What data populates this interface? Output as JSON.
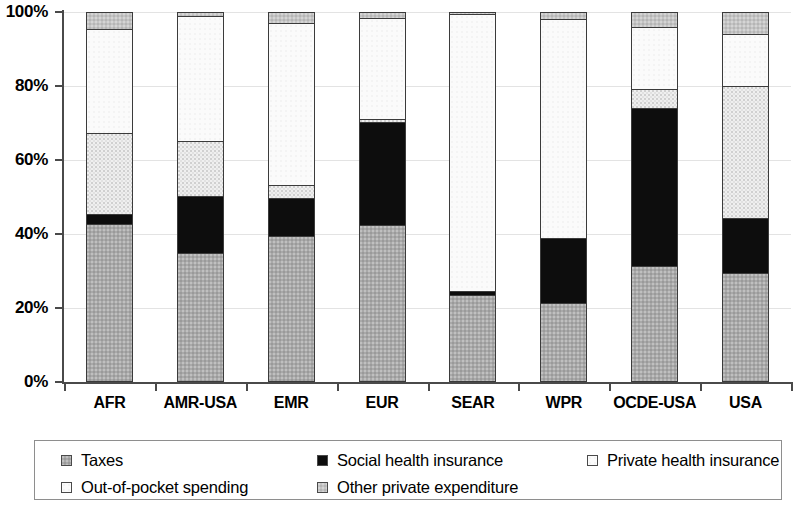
{
  "chart_data": {
    "type": "bar",
    "title": "",
    "subtitle": "",
    "xlabel": "",
    "ylabel": "",
    "ylim": [
      0,
      100
    ],
    "y_tick_labels": [
      "0%",
      "20%",
      "40%",
      "60%",
      "80%",
      "100%"
    ],
    "y_ticks": [
      0,
      20,
      40,
      60,
      80,
      100
    ],
    "grid": true,
    "stacked": true,
    "stack_order_bottom_to_top": [
      "Taxes",
      "Social health insurance",
      "Private health insurance",
      "Out-of-pocket spending",
      "Other private expenditure"
    ],
    "legend_position": "bottom",
    "categories": [
      "AFR",
      "AMR-USA",
      "EMR",
      "EUR",
      "SEAR",
      "WPR",
      "OCDE-USA",
      "USA"
    ],
    "series": [
      {
        "name": "Taxes",
        "color": "#a9a9a9",
        "values": [
          42.5,
          34.5,
          39.0,
          42.0,
          23.0,
          21.0,
          31.0,
          29.0
        ]
      },
      {
        "name": "Social health insurance",
        "color": "#0d0d0d",
        "values": [
          2.5,
          15.5,
          10.5,
          28.0,
          1.3,
          17.5,
          43.0,
          15.0
        ]
      },
      {
        "name": "Private health insurance",
        "color": "#efefef",
        "values": [
          22.0,
          15.0,
          3.5,
          1.0,
          0.0,
          0.0,
          5.0,
          36.0
        ]
      },
      {
        "name": "Out-of-pocket spending",
        "color": "#fbfbfb",
        "values": [
          28.5,
          34.0,
          44.0,
          27.5,
          75.2,
          59.5,
          17.0,
          14.0
        ]
      },
      {
        "name": "Other private expenditure",
        "color": "#c4c4c4",
        "values": [
          4.5,
          1.0,
          3.0,
          1.5,
          0.5,
          2.0,
          4.0,
          6.0
        ]
      }
    ]
  },
  "legend": {
    "items": [
      {
        "label": "Taxes",
        "swatch": "taxes"
      },
      {
        "label": "Social health insurance",
        "swatch": "social"
      },
      {
        "label": "Private health insurance",
        "swatch": "private"
      },
      {
        "label": "Out-of-pocket spending",
        "swatch": "oop"
      },
      {
        "label": "Other private expenditure",
        "swatch": "other"
      }
    ]
  }
}
